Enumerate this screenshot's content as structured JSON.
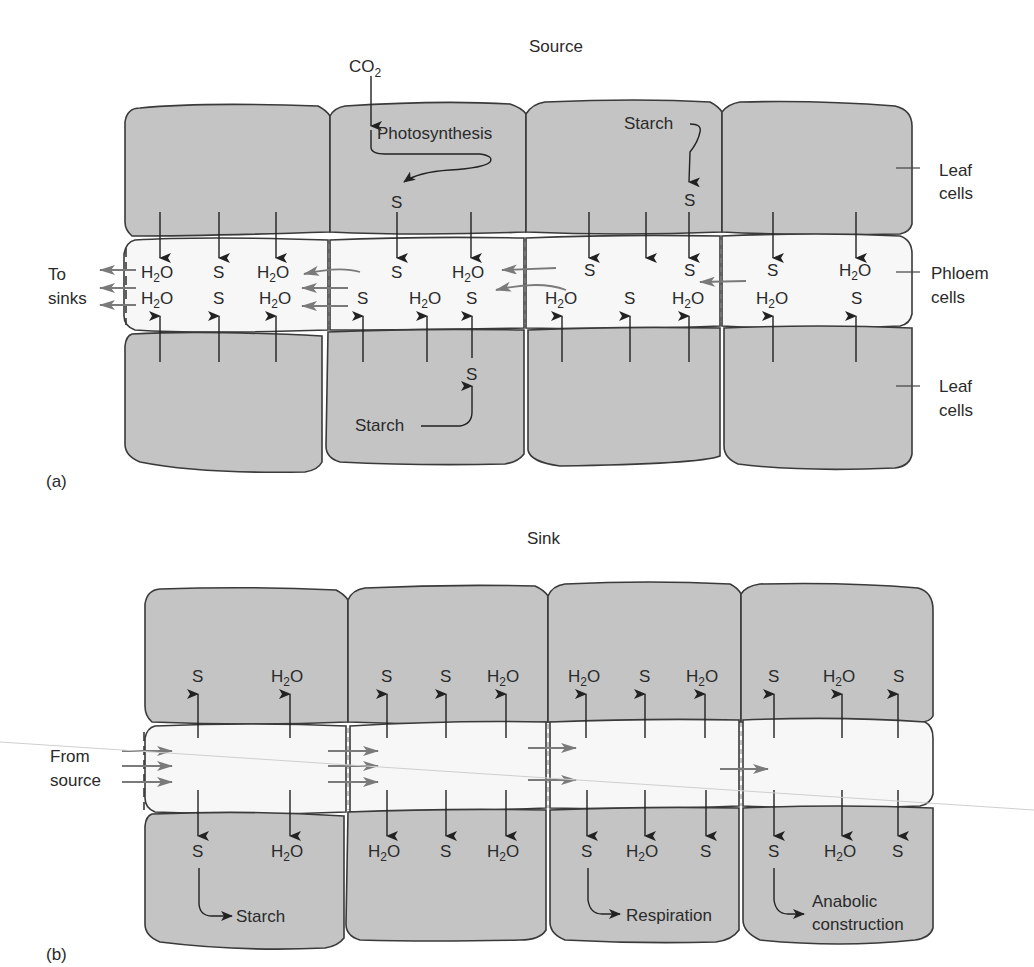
{
  "figure": {
    "panel_a": {
      "title": "Source",
      "panel_label": "(a)",
      "inputs": {
        "co2": "CO",
        "co2_sub": "2",
        "photosynthesis": "Photosynthesis",
        "starch_top": "Starch",
        "starch_bottom": "Starch"
      },
      "side_labels": {
        "leaf_top_1": "Leaf",
        "leaf_top_2": "cells",
        "phloem_1": "Phloem",
        "phloem_2": "cells",
        "leaf_bottom_1": "Leaf",
        "leaf_bottom_2": "cells",
        "to_sinks_1": "To",
        "to_sinks_2": "sinks"
      },
      "phloem_row1": [
        "H2O",
        "S",
        "H2O",
        "S",
        "H2O",
        "S",
        "S",
        "S",
        "H2O"
      ],
      "phloem_row2": [
        "H2O",
        "S",
        "H2O",
        "S",
        "H2O",
        "S",
        "H2O",
        "S",
        "H2O",
        "H2O",
        "S"
      ],
      "leaf_products": [
        "S",
        "S",
        "S"
      ]
    },
    "panel_b": {
      "title": "Sink",
      "panel_label": "(b)",
      "side_labels": {
        "from_source_1": "From",
        "from_source_2": "source"
      },
      "top_cells_row": [
        "S",
        "H2O",
        "S",
        "S",
        "H2O",
        "H2O",
        "S",
        "H2O",
        "S",
        "H2O",
        "S"
      ],
      "bottom_cells_row": [
        "S",
        "H2O",
        "H2O",
        "S",
        "H2O",
        "S",
        "H2O",
        "S",
        "S",
        "H2O",
        "S"
      ],
      "fates": {
        "starch": "Starch",
        "respiration": "Respiration",
        "anabolic_1": "Anabolic",
        "anabolic_2": "construction"
      }
    },
    "glyphs": {
      "h": "H",
      "sub2": "2",
      "o": "O",
      "s": "S"
    }
  }
}
